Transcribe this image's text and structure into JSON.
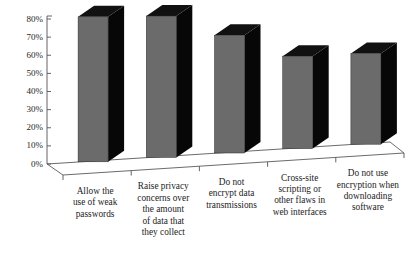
{
  "chart_data": {
    "type": "bar",
    "title": "",
    "subtitle": "",
    "xlabel": "",
    "ylabel": "",
    "ylim": [
      0,
      80
    ],
    "grid": false,
    "legend": null,
    "style": "3d-column",
    "categories": [
      "Allow the use of weak passwords",
      "Raise privacy concerns over the amount of data that they collect",
      "Do not encrypt data transmissions",
      "Cross-site scripting or other flaws in web interfaces",
      "Do not use encryption when downloading software"
    ],
    "category_lines": [
      [
        "Allow the",
        "use of weak",
        "passwords"
      ],
      [
        "Raise privacy",
        "concerns over",
        "the amount",
        "of data that",
        "they collect"
      ],
      [
        "Do not",
        "encrypt data",
        "transmissions"
      ],
      [
        "Cross-site",
        "scripting or",
        "other flaws in",
        "web interfaces"
      ],
      [
        "Do not use",
        "encryption when",
        "downloading",
        "software"
      ]
    ],
    "values": [
      80,
      78,
      65,
      51,
      50
    ],
    "value_labels": [
      "80%",
      "78%",
      "65%",
      "51%",
      "50%"
    ],
    "ytick_values": [
      0,
      10,
      20,
      30,
      40,
      50,
      60,
      70,
      80
    ],
    "ytick_labels": [
      "0%",
      "10%",
      "20%",
      "30%",
      "40%",
      "50%",
      "60%",
      "70%",
      "80%"
    ],
    "colors": {
      "bar_front": "#6b6b6b",
      "bar_side": "#070707",
      "bar_top": "#111111",
      "axis": "#545454",
      "text": "#1c1c1c",
      "background": "#ffffff"
    }
  }
}
